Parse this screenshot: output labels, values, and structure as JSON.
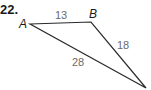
{
  "problem": {
    "number": "22."
  },
  "triangle": {
    "vertices": [
      {
        "label": "A",
        "x": 30,
        "y": 24
      },
      {
        "label": "B",
        "x": 91,
        "y": 22
      },
      {
        "label": "",
        "x": 146,
        "y": 88
      }
    ],
    "sides": [
      {
        "from": "A",
        "to": "B",
        "length": "13"
      },
      {
        "from": "B",
        "to": "C",
        "length": "18"
      },
      {
        "from": "A",
        "to": "C",
        "length": "28"
      }
    ],
    "stroke_color": "#2a2a2a",
    "side_label_color": "#6b6b6b"
  }
}
